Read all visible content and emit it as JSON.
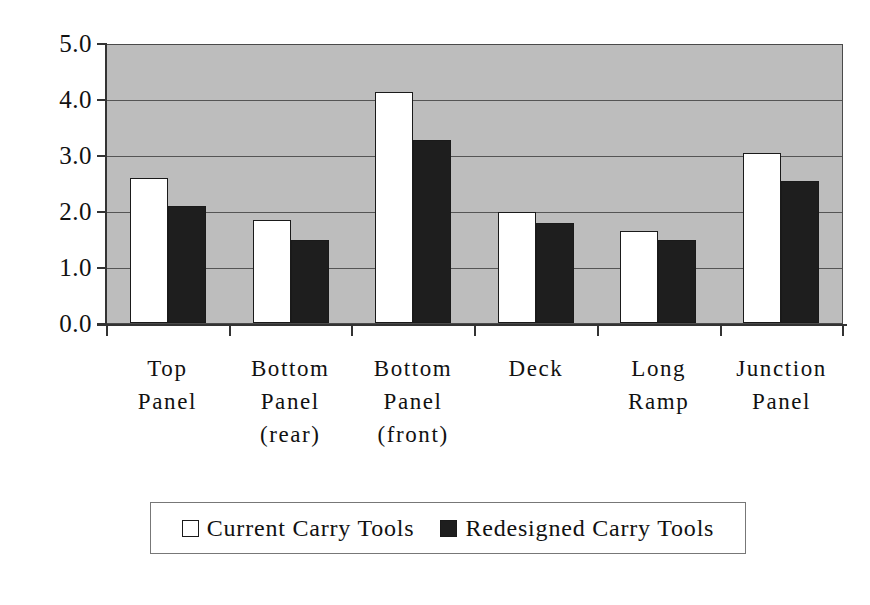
{
  "chart_data": {
    "type": "bar",
    "title": "",
    "xlabel": "",
    "ylabel": "",
    "ylim": [
      0.0,
      5.0
    ],
    "grid": true,
    "legend_position": "bottom",
    "categories": [
      "Top Panel",
      "Bottom Panel (rear)",
      "Bottom Panel (front)",
      "Deck",
      "Long Ramp",
      "Junction Panel"
    ],
    "category_lines": [
      [
        "Top",
        "Panel"
      ],
      [
        "Bottom",
        "Panel",
        "(rear)"
      ],
      [
        "Bottom",
        "Panel",
        "(front)"
      ],
      [
        "Deck"
      ],
      [
        "Long",
        "Ramp"
      ],
      [
        "Junction",
        "Panel"
      ]
    ],
    "ytick_labels": [
      "5.0",
      "4.0",
      "3.0",
      "2.0",
      "1.0",
      "0.0"
    ],
    "ytick_values": [
      5.0,
      4.0,
      3.0,
      2.0,
      1.0,
      0.0
    ],
    "series": [
      {
        "name": "Current Carry Tools",
        "color": "#ffffff",
        "values": [
          2.6,
          1.85,
          4.15,
          2.0,
          1.65,
          3.05
        ]
      },
      {
        "name": "Redesigned Carry Tools",
        "color": "#1e1e1e",
        "values": [
          2.1,
          1.5,
          3.3,
          1.8,
          1.5,
          2.55
        ]
      }
    ]
  },
  "legend": {
    "entries": [
      {
        "label": "Current Carry Tools",
        "swatch": "white-square-swatch"
      },
      {
        "label": "Redesigned Carry Tools",
        "swatch": "black-square-swatch"
      }
    ]
  },
  "colors": {
    "plot_background": "#bdbdbd",
    "gridline": "#555555",
    "axis": "#333333",
    "current_bar": "#ffffff",
    "redesigned_bar": "#1e1e1e",
    "page_background": "#ffffff"
  }
}
